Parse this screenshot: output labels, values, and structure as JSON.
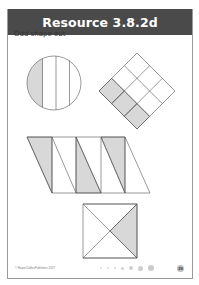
{
  "header": {
    "title": "Resource 3.8.2d"
  },
  "subtitle": "Odd shape out",
  "shapes": [
    {
      "name": "circle",
      "parts": 4,
      "shaded": 1
    },
    {
      "name": "diamond-grid",
      "parts": 9,
      "shaded": 3
    },
    {
      "name": "parallelogram",
      "parts": 8,
      "shaded": 3
    },
    {
      "name": "square-crossed",
      "parts": 4,
      "shaded": 1
    }
  ],
  "colors": {
    "header_bg": "#4a4a4a",
    "shade": "#d8d8d8",
    "line": "#555555"
  },
  "footer": {
    "copyright": "© HarperCollinsPublishers 2017",
    "page_number": "29"
  }
}
